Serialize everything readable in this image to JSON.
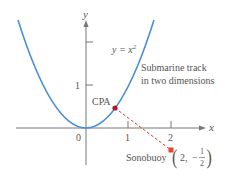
{
  "diagram": {
    "axes": {
      "x_label": "x",
      "y_label": "y",
      "origin_label": "0",
      "x_ticks": [
        "1",
        "2"
      ],
      "y_ticks": [
        "1"
      ]
    },
    "curve": {
      "equation_lhs": "y = x",
      "equation_exp": "2",
      "color": "#4a8fd6"
    },
    "annotation": {
      "line1": "Submarine track",
      "line2": "in two dimensions"
    },
    "cpa": {
      "label": "CPA",
      "color": "#b0182a"
    },
    "sonobuoy": {
      "label": "Sonobuoy",
      "coord_x": "2,",
      "coord_sign": "−",
      "frac_num": "1",
      "frac_den": "2",
      "color": "#e8452c"
    },
    "dashed_line_color": "#d9433a"
  }
}
